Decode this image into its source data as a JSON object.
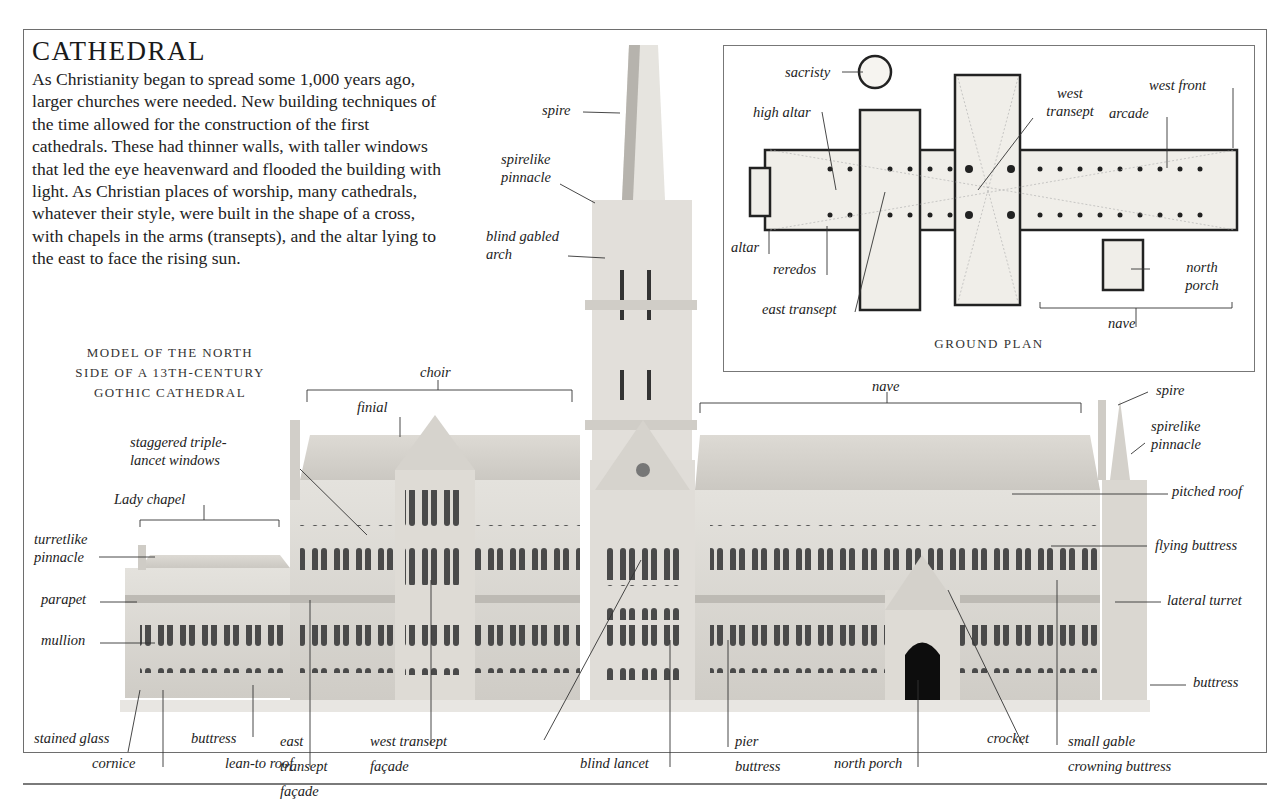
{
  "header": {
    "title": "CATHEDRAL",
    "intro_text": "As Christianity began to spread some 1,000 years ago, larger churches were needed. New building techniques of the time allowed for the construction of the first cathedrals. These had thinner walls, with taller windows that led the eye heavenward and flooded the building with light. As Christian places of worship, many cathedrals, whatever their style, were built in the shape of a cross, with chapels in the arms (transepts), and the altar lying to the east to face the rising sun."
  },
  "model_caption": {
    "line1": "MODEL OF THE NORTH",
    "line2": "SIDE OF A 13TH-CENTURY",
    "line3": "GOTHIC CATHEDRAL"
  },
  "ground_plan": {
    "title": "GROUND PLAN",
    "labels": {
      "sacristy": "sacristy",
      "high_altar": "high altar",
      "west_transept": "west transept",
      "arcade": "arcade",
      "west_front": "west front",
      "altar": "altar",
      "reredos": "reredos",
      "east_transept": "east transept",
      "north_porch": "north porch",
      "nave": "nave"
    }
  },
  "model_labels": {
    "spire_top": "spire",
    "spirelike_pinnacle_top": "spirelike pinnacle",
    "blind_gabled_arch": "blind gabled arch",
    "choir": "choir",
    "finial": "finial",
    "nave": "nave",
    "spire_right": "spire",
    "spirelike_pinnacle_right": "spirelike pinnacle",
    "staggered_triple_lancet_windows": "staggered triple-lancet windows",
    "lady_chapel": "Lady chapel",
    "turretlike_pinnacle": "turretlike pinnacle",
    "parapet": "parapet",
    "mullion": "mullion",
    "pitched_roof": "pitched roof",
    "flying_buttress": "flying buttress",
    "lateral_turret": "lateral turret",
    "buttress_right": "buttress",
    "stained_glass": "stained glass",
    "cornice": "cornice",
    "buttress_bottom": "buttress",
    "lean_to_roof": "lean-to roof",
    "east_transept_facade": "east transept façade",
    "west_transept_facade": "west transept façade",
    "blind_lancet": "blind lancet",
    "pier_buttress": "pier buttress",
    "north_porch": "north porch",
    "crocket": "crocket",
    "small_gable_crowning_buttress": "small gable crowning buttress"
  }
}
